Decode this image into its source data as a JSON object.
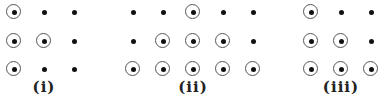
{
  "grids": [
    {
      "label": "(i)",
      "label_x": 44,
      "columns_x": [
        14,
        44,
        74
      ],
      "rows": [
        [
          1,
          0,
          0
        ],
        [
          1,
          1,
          0
        ],
        [
          1,
          0,
          0
        ]
      ]
    },
    {
      "label": "(ii)",
      "label_x": 193,
      "columns_x": [
        133,
        163,
        193,
        223,
        253
      ],
      "rows": [
        [
          0,
          0,
          1,
          0,
          0
        ],
        [
          0,
          1,
          1,
          1,
          0
        ],
        [
          1,
          1,
          1,
          1,
          1
        ]
      ]
    },
    {
      "label": "(iii)",
      "label_x": 341,
      "columns_x": [
        311,
        341,
        371
      ],
      "rows": [
        [
          1,
          0,
          0
        ],
        [
          1,
          1,
          0
        ],
        [
          1,
          1,
          1
        ]
      ]
    }
  ],
  "rows_y": [
    12,
    41,
    69
  ],
  "legend": {
    "circled": "dot with surrounding circle",
    "plain": "plain dot"
  },
  "colors": {
    "dot": "#111111",
    "ring": "#555555",
    "label": "#222222"
  }
}
